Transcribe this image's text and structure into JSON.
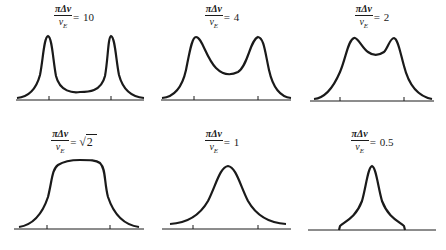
{
  "figure": {
    "stroke_color": "#1a1a1a",
    "background": "#ffffff"
  },
  "label_parts": {
    "numerator": "πΔν",
    "denominator_symbol": "ν",
    "denominator_subscript": "E",
    "equals": "="
  },
  "panels": [
    {
      "id": "p10",
      "value": "10",
      "sqrt": false,
      "shape": "two sharp well-separated peaks with deep dip"
    },
    {
      "id": "p4",
      "value": "4",
      "sqrt": false,
      "shape": "two peaks with moderate central dip"
    },
    {
      "id": "p2",
      "value": "2",
      "sqrt": false,
      "shape": "two peaks merging with shallow dip"
    },
    {
      "id": "psqrt2",
      "value": "2",
      "sqrt": true,
      "shape": "flat-topped single band"
    },
    {
      "id": "p1",
      "value": "1",
      "sqrt": false,
      "shape": "single broad peak"
    },
    {
      "id": "p05",
      "value": "0.5",
      "sqrt": false,
      "shape": "single narrow peak"
    }
  ]
}
